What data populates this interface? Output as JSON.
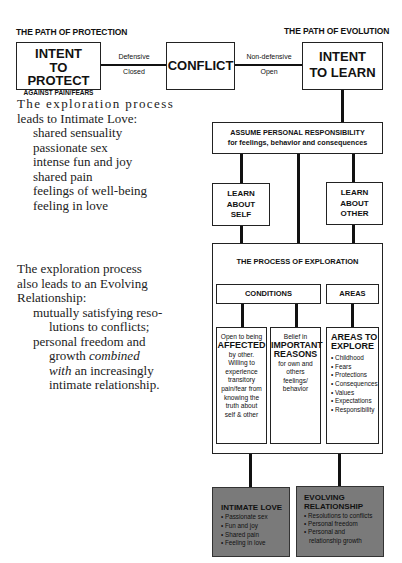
{
  "headers": {
    "protection": "THE PATH OF PROTECTION",
    "evolution": "THE PATH OF EVOLUTION"
  },
  "top_row": {
    "protect_box": {
      "line1": "INTENT",
      "line2": "TO PROTECT",
      "line3": "AGAINST PAIN/FEARS"
    },
    "left_connector": {
      "above": "Defensive",
      "below": "Closed"
    },
    "conflict_box": "CONFLICT",
    "right_connector": {
      "above": "Non-defensive",
      "below": "Open"
    },
    "learn_box": {
      "line1": "INTENT",
      "line2": "TO LEARN"
    }
  },
  "responsibility_box": {
    "line1": "ASSUME PERSONAL RESPONSIBILITY",
    "line2": "for feelings, behavior and consequences"
  },
  "learn_self": {
    "line1": "LEARN",
    "line2": "ABOUT",
    "line3": "SELF"
  },
  "learn_other": {
    "line1": "LEARN",
    "line2": "ABOUT",
    "line3": "OTHER"
  },
  "process": {
    "title": "THE PROCESS OF EXPLORATION",
    "conditions_label": "CONDITIONS",
    "areas_label": "AREAS",
    "affected": {
      "pre": "Open to being",
      "emph": "AFFECTED",
      "post": "by other. Willing to experience transitory pain/fear from knowing the truth about self & other"
    },
    "reasons": {
      "pre": "Belief in",
      "emph1": "IMPORTANT",
      "emph2": "REASONS",
      "post": "for own and others feelings/ behavior"
    },
    "areas_box": {
      "title1": "AREAS TO",
      "title2": "EXPLORE",
      "items": [
        "Childhood",
        "Fears",
        "Protections",
        "Consequences",
        "Values",
        "Expectations",
        "Responsibility"
      ]
    }
  },
  "outcomes": {
    "intimate_love": {
      "title": "INTIMATE LOVE",
      "items": [
        "Passionate sex",
        "Fun and joy",
        "Shared pain",
        "Feeling in love"
      ]
    },
    "evolving": {
      "title1": "EVOLVING",
      "title2": "RELATIONSHIP",
      "items": [
        "Resolutions to conflicts",
        "Personal freedom",
        "Personal and relationship growth"
      ]
    }
  },
  "text": {
    "para1_line1": "The exploration process",
    "para1_line2": "leads to Intimate Love:",
    "love_list": [
      "shared sensuality",
      "passionate sex",
      "intense fun and joy",
      "shared pain",
      "feelings of well-being",
      "feeling in love"
    ],
    "para2_line1": "The exploration process",
    "para2_line2": "also leads to an Evolving",
    "para2_line3": "Relationship:",
    "evolve_a1": "mutually satisfying reso-",
    "evolve_a2": "lutions to conflicts;",
    "evolve_b1": "personal freedom and",
    "evolve_b2_pre": "growth ",
    "evolve_b2_em": "combined",
    "evolve_b3_em": "with",
    "evolve_b3_post": " an increasingly",
    "evolve_b4": "intimate relationship."
  },
  "colors": {
    "outcome_fill": "#7a7a7a",
    "line": "#111111"
  }
}
